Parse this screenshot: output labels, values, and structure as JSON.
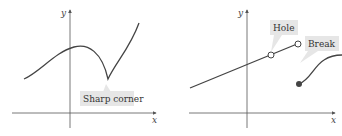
{
  "left_graph": {
    "axis_x_label": "x",
    "axis_y_label": "y",
    "callout": "Sharp corner"
  },
  "right_graph": {
    "axis_x_label": "x",
    "axis_y_label": "y",
    "callout_hole": "Hole",
    "callout_break": "Break"
  },
  "colors": {
    "axis": "#555555",
    "curve": "#444444",
    "callout_bg": "#e6e6e6"
  }
}
